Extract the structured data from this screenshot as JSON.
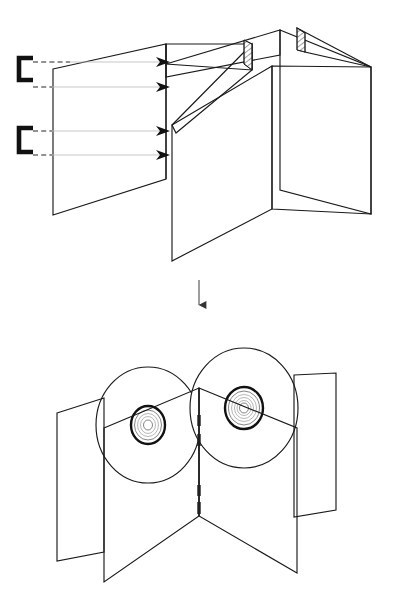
{
  "document": {
    "title": "Saddle-stitched multi-panel disc wallet assembly diagram",
    "background_color": "#ffffff",
    "line_color": "#1a1a1a",
    "guide_color": "#b9b9b9",
    "width_px": 398,
    "height_px": 616
  },
  "figures": [
    {
      "id": "upper",
      "name": "Open unfolded wallet being stapled",
      "caption": "",
      "elements": {
        "staples": [
          {
            "name": "upper-staple",
            "label": "",
            "x": 19,
            "y": 58,
            "width": 14,
            "height": 22
          },
          {
            "name": "lower-staple",
            "label": "",
            "x": 19,
            "y": 128,
            "width": 14,
            "height": 24
          }
        ],
        "guide_lines": [
          {
            "name": "guide-1",
            "y": 62,
            "from_x": 33,
            "to_x": 165,
            "style": "dashed"
          },
          {
            "name": "guide-2",
            "y": 87,
            "from_x": 33,
            "to_x": 165,
            "style": "solid"
          },
          {
            "name": "guide-3",
            "y": 131,
            "from_x": 33,
            "to_x": 165,
            "style": "dashed"
          },
          {
            "name": "guide-4",
            "y": 155,
            "from_x": 33,
            "to_x": 165,
            "style": "dashed"
          }
        ],
        "arrowheads": [
          {
            "name": "arrowhead-1",
            "x": 166,
            "y": 62
          },
          {
            "name": "arrowhead-2",
            "x": 166,
            "y": 87
          },
          {
            "name": "arrowhead-3",
            "x": 166,
            "y": 131
          },
          {
            "name": "arrowhead-4",
            "x": 166,
            "y": 155
          }
        ],
        "hatched_spines": [
          {
            "name": "hatch-spine-inner",
            "label": ""
          },
          {
            "name": "hatch-spine-outer",
            "label": ""
          }
        ]
      }
    },
    {
      "id": "transition",
      "name": "Downward process arrow",
      "arrow": {
        "name": "process-arrow-down",
        "x": 199,
        "from_y": 280,
        "to_y": 313,
        "direction": "down"
      }
    },
    {
      "id": "lower",
      "name": "Folded wallet with two discs seated",
      "caption": "",
      "elements": {
        "discs": [
          {
            "name": "disc-left",
            "cx": 148,
            "cy": 425,
            "rx": 52,
            "ry": 58
          },
          {
            "name": "disc-right",
            "cx": 244,
            "cy": 408,
            "rx": 54,
            "ry": 60
          }
        ],
        "spine_staple_marks": [
          {
            "name": "spine-mark-1",
            "y1": 415,
            "y2": 426
          },
          {
            "name": "spine-mark-2",
            "y1": 434,
            "y2": 446
          },
          {
            "name": "spine-mark-3",
            "y1": 485,
            "y2": 496
          },
          {
            "name": "spine-mark-4",
            "y1": 502,
            "y2": 514
          }
        ]
      }
    }
  ]
}
